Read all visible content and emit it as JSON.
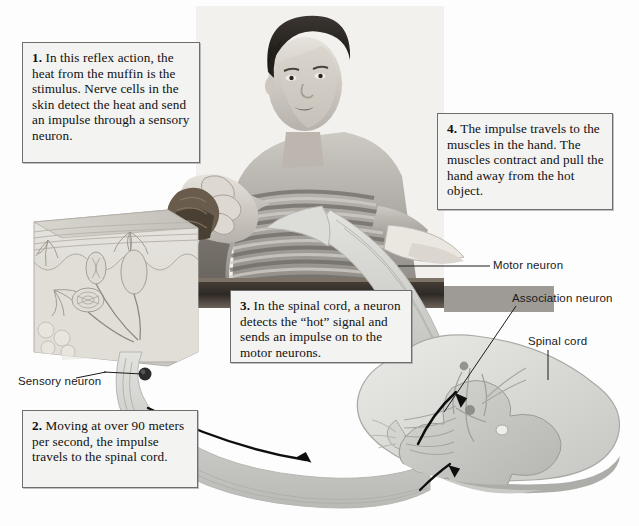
{
  "figure": {
    "type": "labeled-photo-diagram",
    "background_color": "#fdfdfd"
  },
  "callouts": [
    {
      "id": "step-1",
      "number": "1.",
      "text": " In this reflex action, the heat from the muffin is the stimulus. Nerve cells in the skin detect the heat and send an impulse through a sensory neuron.",
      "position": "top-left"
    },
    {
      "id": "step-2",
      "number": "2.",
      "text": " Moving at over 90 meters per second, the impulse travels to the spinal cord.",
      "position": "bottom-left"
    },
    {
      "id": "step-3",
      "number": "3.",
      "text": " In the spinal cord, a neuron detects the “hot” signal and sends an impulse on to the motor neurons.",
      "position": "center"
    },
    {
      "id": "step-4",
      "number": "4.",
      "text": " The impulse travels to the muscles in the hand. The muscles contract and pull the hand away from the hot object.",
      "position": "top-right"
    }
  ],
  "labels": {
    "motor_neuron": "Motor neuron",
    "association_neuron": "Association neuron",
    "spinal_cord": "Spinal cord",
    "sensory_neuron": "Sensory neuron"
  },
  "scene": {
    "photo_subject": "boy in striped shirt reaching for a hot muffin on a table",
    "skin_block": "cutaway block of skin showing nerve endings",
    "spinal_cord_section": "cross-section of spinal cord with gray matter butterfly",
    "pathway_arrows": [
      {
        "name": "sensory-pathway-arrow",
        "direction": "left-to-right",
        "description": "impulse travels from skin to spinal cord"
      },
      {
        "name": "spinal-relay-arrow",
        "direction": "upward-curve",
        "description": "impulse relayed inside spinal cord"
      },
      {
        "name": "motor-pathway-arrow",
        "direction": "upward",
        "description": "impulse travels to muscles in hand"
      }
    ]
  },
  "colors": {
    "callout_fill": "#f3f3f1",
    "callout_border": "#6e6e6e",
    "nerve_band": "#cfd0cc",
    "table_dark": "#3b342e",
    "text": "#101010"
  }
}
